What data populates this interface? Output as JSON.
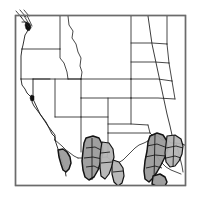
{
  "figure": {
    "kind": "range-distribution-map",
    "region": "Western United States",
    "width": 200,
    "height": 200,
    "background_color": "#ffffff"
  },
  "frame": {
    "x": 15,
    "y": 15,
    "width": 171,
    "height": 171,
    "stroke_color": "#6b6b6b",
    "fill_color": "#ffffff"
  },
  "style": {
    "border_color": "#1a1a1a",
    "shade_color": "#9b9b9b",
    "shade_light_color": "#b4b4b4",
    "shade_outline_color": "#141414",
    "marker_color": "#111111",
    "leader_color": "#2a2a2a"
  },
  "states": [
    {
      "name": "Washington",
      "label": "WA"
    },
    {
      "name": "Oregon",
      "label": "OR"
    },
    {
      "name": "California",
      "label": "CA"
    },
    {
      "name": "Idaho",
      "label": "ID"
    },
    {
      "name": "Nevada",
      "label": "NV"
    },
    {
      "name": "Montana",
      "label": "MT"
    },
    {
      "name": "Wyoming",
      "label": "WY"
    },
    {
      "name": "Utah",
      "label": "UT"
    },
    {
      "name": "Arizona",
      "label": "AZ"
    },
    {
      "name": "Colorado",
      "label": "CO"
    },
    {
      "name": "New Mexico",
      "label": "NM"
    },
    {
      "name": "North Dakota",
      "label": "ND"
    },
    {
      "name": "South Dakota",
      "label": "SD"
    },
    {
      "name": "Nebraska",
      "label": "NE"
    },
    {
      "name": "Kansas",
      "label": "KS"
    },
    {
      "name": "Oklahoma",
      "label": "OK"
    },
    {
      "name": "Texas",
      "label": "TX"
    }
  ],
  "range_areas": [
    {
      "id": "southeast-arizona",
      "label": "Southeastern Arizona range",
      "shade": "medium"
    },
    {
      "id": "southwest-new-mexico",
      "label": "Southwestern New Mexico range",
      "shade": "medium"
    },
    {
      "id": "south-central-new-mexico",
      "label": "South-central New Mexico range",
      "shade": "medium"
    },
    {
      "id": "west-texas-big-bend",
      "label": "West Texas / Big Bend range",
      "shade": "medium"
    },
    {
      "id": "texas-edwards-plateau",
      "label": "Texas Edwards Plateau range",
      "shade": "light"
    },
    {
      "id": "baja-border-patch",
      "label": "Lower Colorado / border patch",
      "shade": "medium"
    }
  ],
  "localities": [
    {
      "id": "puget-sound",
      "label": "Puget Sound locality",
      "x": 29,
      "y": 25
    },
    {
      "id": "san-francisco-bay",
      "label": "San Francisco Bay locality",
      "x": 32,
      "y": 97
    }
  ],
  "leader_lines": {
    "label": "Callout leader lines to Puget Sound locality",
    "count": 3
  },
  "reference_line": {
    "label": "Diagonal reference line (Great Plains)",
    "visible": true
  }
}
